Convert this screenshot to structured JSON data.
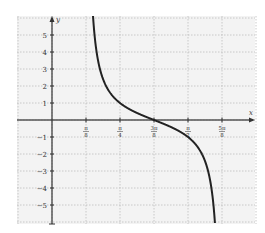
{
  "chart_data": {
    "type": "line",
    "title": "",
    "xlabel": "x",
    "ylabel": "y",
    "function": "y = -tan(2x - 3π/4)",
    "x_ticks": [
      {
        "value": 0.3927,
        "label_num": "π",
        "label_den": "8"
      },
      {
        "value": 0.7854,
        "label_num": "π",
        "label_den": "4"
      },
      {
        "value": 1.1781,
        "label_num": "3π",
        "label_den": "8"
      },
      {
        "value": 1.5708,
        "label_num": "π",
        "label_den": "2"
      },
      {
        "value": 1.9635,
        "label_num": "5π",
        "label_den": "8"
      }
    ],
    "y_ticks": [
      5,
      4,
      3,
      2,
      1,
      -1,
      -2,
      -3,
      -4,
      -5
    ],
    "xlim": [
      -0.41,
      2.34
    ],
    "ylim": [
      -6,
      6
    ],
    "grid": true,
    "grid_style": "dotted",
    "asymptotes": [
      0.3927,
      1.9635
    ],
    "series": [
      {
        "name": "y = -tan(2x - 3π/4)",
        "points": [
          {
            "x": 0.42,
            "y": 6.0
          },
          {
            "x": 0.45,
            "y": 4.3
          },
          {
            "x": 0.5,
            "y": 2.9
          },
          {
            "x": 0.6,
            "y": 1.8
          },
          {
            "x": 0.7854,
            "y": 1.0
          },
          {
            "x": 1.0,
            "y": 0.36
          },
          {
            "x": 1.1781,
            "y": 0.0
          },
          {
            "x": 1.35,
            "y": -0.36
          },
          {
            "x": 1.5708,
            "y": -1.0
          },
          {
            "x": 1.75,
            "y": -2.3
          },
          {
            "x": 1.85,
            "y": -4.3
          },
          {
            "x": 1.9,
            "y": -6.0
          }
        ]
      }
    ]
  },
  "axes": {
    "x_label": "x",
    "y_label": "y"
  }
}
